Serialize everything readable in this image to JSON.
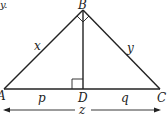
{
  "diagram": {
    "type": "right-triangle-with-altitude",
    "fragment_text": "y.",
    "vertices": {
      "A": "A",
      "B": "B",
      "C": "C",
      "D": "D"
    },
    "side_labels": {
      "AB": "x",
      "BC": "y",
      "AD": "p",
      "DC": "q",
      "AC": "z"
    },
    "markers": [
      "right-angle-at-B",
      "right-angle-at-D"
    ],
    "line_color": "#222222"
  }
}
